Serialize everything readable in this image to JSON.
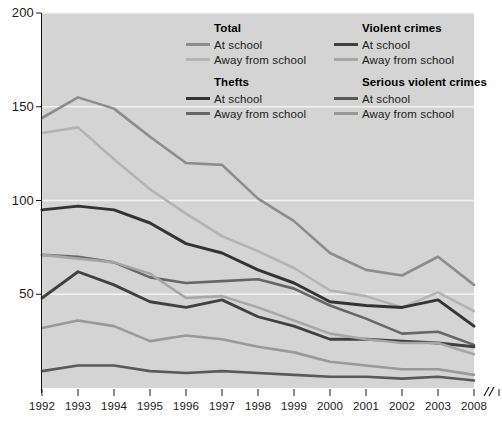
{
  "chart_data": {
    "type": "line",
    "title": "",
    "xlabel": "",
    "ylabel": "",
    "xlim": [
      1992,
      2004
    ],
    "ylim": [
      0,
      200
    ],
    "grid": true,
    "grid_axis": "y",
    "legend_position": "inside-top-right",
    "axis_break_after": 2004,
    "x": [
      1992,
      1993,
      1994,
      1995,
      1996,
      1997,
      1998,
      1999,
      2000,
      2001,
      2002,
      2003,
      2004
    ],
    "categories": [
      "1992",
      "1993",
      "1994",
      "1995",
      "1996",
      "1997",
      "1998",
      "1999",
      "2000",
      "2001",
      "2002",
      "2003",
      "2004"
    ],
    "ytick_values": [
      200,
      150,
      100,
      50
    ],
    "ytick_labels": [
      "200",
      "150",
      "100",
      "50"
    ],
    "xtick_labels": [
      "1992",
      "1993",
      "1994",
      "1995",
      "1996",
      "1997",
      "1998",
      "1999",
      "2000",
      "2001",
      "2002",
      "2003",
      "2008"
    ],
    "series": [
      {
        "name": "Total - At school",
        "group": "Total",
        "location": "At school",
        "color": "#8c8c8c",
        "width": 2.6,
        "values": [
          144,
          155,
          149,
          134,
          120,
          119,
          101,
          89,
          72,
          63,
          60,
          70,
          55
        ]
      },
      {
        "name": "Total - Away from school",
        "group": "Total",
        "location": "Away from school",
        "color": "#b3b3b3",
        "width": 2.6,
        "values": [
          136,
          139,
          122,
          106,
          93,
          81,
          73,
          64,
          52,
          49,
          43,
          51,
          41
        ]
      },
      {
        "name": "Thefts - At school",
        "group": "Thefts",
        "location": "At school",
        "color": "#333333",
        "width": 3.0,
        "values": [
          95,
          97,
          95,
          88,
          77,
          72,
          63,
          56,
          46,
          44,
          43,
          47,
          33
        ]
      },
      {
        "name": "Thefts - Away from school",
        "group": "Thefts",
        "location": "Away from school",
        "color": "#666666",
        "width": 2.6,
        "values": [
          71,
          70,
          67,
          59,
          56,
          57,
          58,
          53,
          44,
          37,
          29,
          30,
          23
        ]
      },
      {
        "name": "Violent crimes - At school",
        "group": "Violent crimes",
        "location": "At school",
        "color": "#404040",
        "width": 2.8,
        "values": [
          48,
          62,
          55,
          46,
          43,
          47,
          38,
          33,
          26,
          26,
          25,
          24,
          22
        ]
      },
      {
        "name": "Violent crimes - Away from school",
        "group": "Violent crimes",
        "location": "Away from school",
        "color": "#a6a6a6",
        "width": 2.6,
        "values": [
          71,
          69,
          67,
          61,
          48,
          49,
          43,
          36,
          29,
          26,
          24,
          24,
          18
        ]
      },
      {
        "name": "Serious violent crimes - At school",
        "group": "Serious violent crimes",
        "location": "At school",
        "color": "#595959",
        "width": 2.6,
        "values": [
          9,
          12,
          12,
          9,
          8,
          9,
          8,
          7,
          6,
          6,
          5,
          6,
          4
        ]
      },
      {
        "name": "Serious violent crimes - Away from school",
        "group": "Serious violent crimes",
        "location": "Away from school",
        "color": "#999999",
        "width": 2.6,
        "values": [
          32,
          36,
          33,
          25,
          28,
          26,
          22,
          19,
          14,
          12,
          10,
          10,
          7
        ]
      }
    ]
  },
  "legend": {
    "columns": [
      {
        "groups": [
          {
            "title": "Total",
            "rows": [
              {
                "label": "At school",
                "color": "#8c8c8c"
              },
              {
                "label": "Away from school",
                "color": "#b3b3b3"
              }
            ]
          },
          {
            "title": "Thefts",
            "rows": [
              {
                "label": "At school",
                "color": "#333333"
              },
              {
                "label": "Away from school",
                "color": "#666666"
              }
            ]
          }
        ]
      },
      {
        "groups": [
          {
            "title": "Violent crimes",
            "rows": [
              {
                "label": "At school",
                "color": "#404040"
              },
              {
                "label": "Away from school",
                "color": "#a6a6a6"
              }
            ]
          },
          {
            "title": "Serious violent crimes",
            "rows": [
              {
                "label": "At school",
                "color": "#595959"
              },
              {
                "label": "Away from school",
                "color": "#999999"
              }
            ]
          }
        ]
      }
    ]
  },
  "style": {
    "plot_background": "#d4d4d4",
    "gridline_color": "#f2f2f2",
    "axis_color": "#1a1a1a",
    "text_color": "#1a1a1a"
  }
}
